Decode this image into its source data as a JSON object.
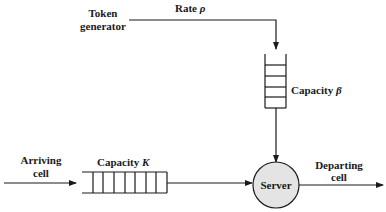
{
  "diagram": {
    "labels": {
      "token_generator_line1": "Token",
      "token_generator_line2": "generator",
      "rate": "Rate ",
      "rate_symbol": "ρ",
      "capacity_beta": "Capacity ",
      "capacity_beta_symbol": "β",
      "arriving_line1": "Arriving",
      "arriving_line2": "cell",
      "capacity_k": "Capacity ",
      "capacity_k_symbol": "K",
      "server": "Server",
      "departing_line1": "Departing",
      "departing_line2": "cell"
    },
    "token_buffer_cells": 6,
    "cell_buffer_cells": 8,
    "colors": {
      "line": "#1a1a1a",
      "server_fill": "#e4e4e4",
      "background": "#ffffff"
    }
  }
}
